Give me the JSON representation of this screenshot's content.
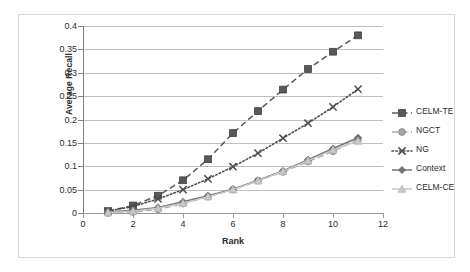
{
  "chart_data": {
    "type": "line",
    "title": "",
    "xlabel": "Rank",
    "ylabel": "Average Recall",
    "xlim": [
      0,
      12
    ],
    "ylim": [
      0,
      0.4
    ],
    "xticks": [
      0,
      2,
      4,
      6,
      8,
      10,
      12
    ],
    "xtick_labels": [
      "0",
      "2",
      "4",
      "6",
      "8",
      "10",
      "12"
    ],
    "yticks": [
      0,
      0.05,
      0.1,
      0.15,
      0.2,
      0.25,
      0.3,
      0.35,
      0.4
    ],
    "ytick_labels": [
      "0",
      "0.05",
      "0.1",
      "0.15",
      "0.2",
      "0.25",
      "0.3",
      "0.35",
      "0.4"
    ],
    "grid": "horizontal",
    "legend_position": "right",
    "x": [
      1,
      2,
      3,
      4,
      5,
      6,
      7,
      8,
      9,
      10,
      11
    ],
    "series": [
      {
        "name": "CELM-TE",
        "color": "#595959",
        "marker": "square",
        "linestyle": "dashed",
        "values": [
          0.004,
          0.016,
          0.037,
          0.07,
          0.115,
          0.171,
          0.218,
          0.264,
          0.308,
          0.345,
          0.38
        ]
      },
      {
        "name": "NGCT",
        "color": "#a6a6a6",
        "marker": "circle",
        "linestyle": "dashed",
        "values": [
          0.0,
          0.002,
          0.008,
          0.02,
          0.035,
          0.05,
          0.069,
          0.088,
          0.11,
          0.132,
          0.157
        ]
      },
      {
        "name": "NG",
        "color": "#4d4d4d",
        "marker": "x",
        "linestyle": "dotted",
        "values": [
          0.004,
          0.014,
          0.03,
          0.05,
          0.073,
          0.099,
          0.128,
          0.16,
          0.192,
          0.227,
          0.265
        ]
      },
      {
        "name": "Context",
        "color": "#737373",
        "marker": "diamond",
        "linestyle": "solid",
        "values": [
          0.002,
          0.006,
          0.012,
          0.024,
          0.037,
          0.051,
          0.07,
          0.09,
          0.114,
          0.138,
          0.161
        ]
      },
      {
        "name": "CELM-CE",
        "color": "#c9c9c9",
        "marker": "triangle",
        "linestyle": "solid",
        "values": [
          0.001,
          0.004,
          0.01,
          0.021,
          0.035,
          0.05,
          0.069,
          0.089,
          0.112,
          0.135,
          0.154
        ]
      }
    ]
  },
  "legend": {
    "items": [
      {
        "label": "CELM-TE"
      },
      {
        "label": "NGCT"
      },
      {
        "label": "NG"
      },
      {
        "label": "Context"
      },
      {
        "label": "CELM-CE"
      }
    ]
  }
}
